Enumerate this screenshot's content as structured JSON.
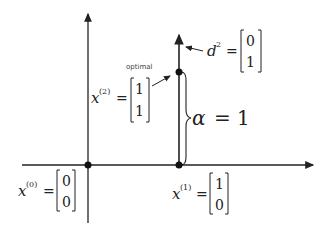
{
  "diagram": {
    "title": "",
    "points": [
      {
        "id": "x0",
        "label_var": "x",
        "label_sup": "(0)",
        "vector": [
          "0",
          "0"
        ],
        "coords": [
          0,
          0
        ]
      },
      {
        "id": "x1",
        "label_var": "x",
        "label_sup": "(1)",
        "vector": [
          "1",
          "0"
        ],
        "coords": [
          1,
          0
        ]
      },
      {
        "id": "x2",
        "label_var": "x",
        "label_sup": "(2)",
        "vector": [
          "1",
          "1"
        ],
        "coords": [
          1,
          1
        ]
      }
    ],
    "direction": {
      "label_var": "d",
      "label_sup": "2",
      "vector": [
        "0",
        "1"
      ]
    },
    "annotation_optimal": "optimal",
    "step": {
      "symbol": "α",
      "equals": "= 1"
    },
    "equals_sign": "="
  }
}
